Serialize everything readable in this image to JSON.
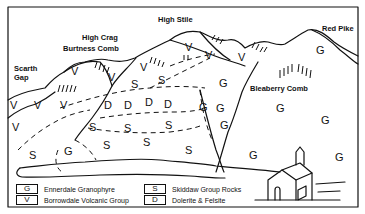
{
  "diagram": {
    "type": "geological sketch",
    "peaks": [
      {
        "id": "scarth-gap",
        "lines": [
          "Scarth",
          "Gap"
        ]
      },
      {
        "id": "high-crag",
        "label": "High Crag"
      },
      {
        "id": "burtness-comb",
        "label": "Burtness Comb"
      },
      {
        "id": "high-stile",
        "label": "High Stile"
      },
      {
        "id": "red-pike",
        "label": "Red Pike"
      },
      {
        "id": "bleaberry-comb",
        "label": "Bleaberry Comb"
      }
    ],
    "scarth_line1": "Scarth",
    "scarth_line2": "Gap",
    "high_crag": "High Crag",
    "burtness_comb": "Burtness Comb",
    "high_stile": "High Stile",
    "red_pike": "Red Pike",
    "bleaberry_comb": "Bleaberry Comb",
    "rock_symbols": {
      "G": "G",
      "V": "V",
      "S": "S",
      "D": "D"
    },
    "legend": [
      {
        "code": "G",
        "label": "Ennerdale Granophyre"
      },
      {
        "code": "V",
        "label": "Borrowdale Volcanic Group"
      },
      {
        "code": "S",
        "label": "Skiddaw Group Rocks"
      },
      {
        "code": "D",
        "label": "Dolerite & Felsite"
      }
    ]
  }
}
